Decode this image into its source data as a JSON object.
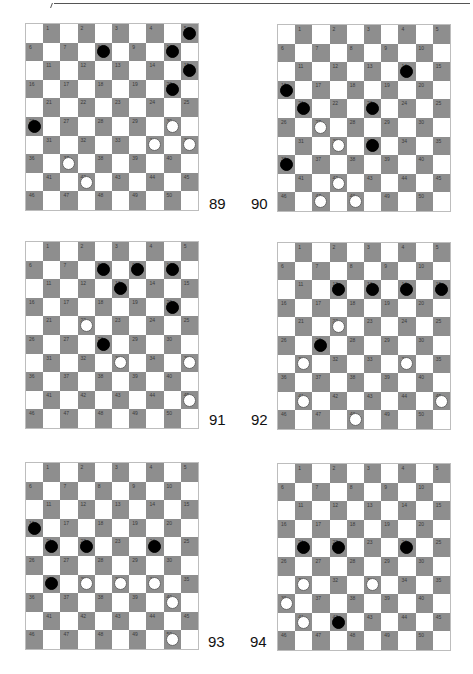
{
  "page": {
    "colors": {
      "dark_square": "#8e8e8e",
      "light_square": "#ffffff",
      "black_piece": "#000000",
      "white_piece": "#ffffff"
    }
  },
  "boards": [
    {
      "label": "89",
      "black": [
        5,
        8,
        10,
        15,
        20,
        26
      ],
      "white": [
        30,
        34,
        35,
        37,
        42
      ]
    },
    {
      "label": "90",
      "black": [
        14,
        16,
        21,
        23,
        33,
        36
      ],
      "white": [
        27,
        32,
        42,
        47,
        48
      ]
    },
    {
      "label": "91",
      "black": [
        8,
        9,
        10,
        13,
        20,
        28
      ],
      "white": [
        22,
        33,
        35,
        45
      ]
    },
    {
      "label": "92",
      "black": [
        12,
        13,
        14,
        15,
        27
      ],
      "white": [
        22,
        31,
        34,
        41,
        45,
        48
      ]
    },
    {
      "label": "93",
      "black": [
        16,
        21,
        22,
        24,
        31
      ],
      "white": [
        32,
        33,
        34,
        40,
        50
      ]
    },
    {
      "label": "94",
      "black": [
        21,
        22,
        24,
        42
      ],
      "white": [
        31,
        33,
        36,
        41
      ]
    }
  ]
}
